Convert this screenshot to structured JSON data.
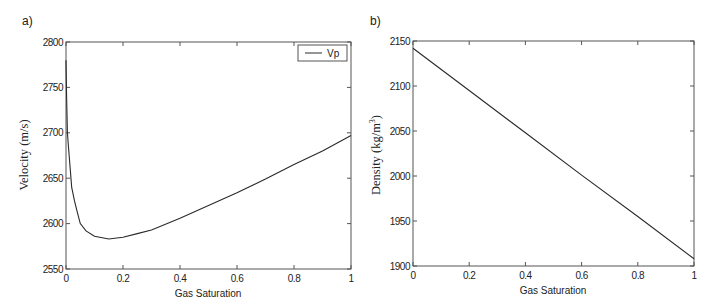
{
  "chart_data": [
    {
      "panel": "a)",
      "type": "line",
      "title": "",
      "xlabel": "Gas Saturation",
      "ylabel": "Velocity (m/s)",
      "xlim": [
        0,
        1
      ],
      "ylim": [
        2550,
        2800
      ],
      "xticks": [
        "0",
        "0.2",
        "0.4",
        "0.6",
        "0.8",
        "1"
      ],
      "yticks": [
        "2550",
        "2600",
        "2650",
        "2700",
        "2750",
        "2800"
      ],
      "grid": false,
      "legend": {
        "position": "upper right",
        "entries": [
          "Vp"
        ]
      },
      "series": [
        {
          "name": "Vp",
          "x": [
            0,
            0.002,
            0.005,
            0.01,
            0.02,
            0.03,
            0.04,
            0.05,
            0.07,
            0.1,
            0.15,
            0.2,
            0.25,
            0.3,
            0.4,
            0.5,
            0.6,
            0.7,
            0.8,
            0.9,
            1.0
          ],
          "y": [
            2780,
            2740,
            2700,
            2680,
            2640,
            2625,
            2612,
            2600,
            2592,
            2586,
            2583,
            2585,
            2589,
            2593,
            2606,
            2620,
            2634,
            2649,
            2665,
            2680,
            2697
          ]
        }
      ]
    },
    {
      "panel": "b)",
      "type": "line",
      "title": "",
      "xlabel": "Gas Saturation",
      "ylabel": "Density (kg/m³)",
      "xlim": [
        0,
        1
      ],
      "ylim": [
        1900,
        2150
      ],
      "xticks": [
        "0",
        "0.2",
        "0.4",
        "0.6",
        "0.8",
        "1"
      ],
      "yticks": [
        "1900",
        "1950",
        "2000",
        "2050",
        "2100",
        "2150"
      ],
      "grid": false,
      "legend": null,
      "series": [
        {
          "name": "Density",
          "x": [
            0,
            0.2,
            0.4,
            0.6,
            0.8,
            1.0
          ],
          "y": [
            2142,
            2095,
            2048,
            2001,
            1955,
            1908
          ]
        }
      ]
    }
  ],
  "panels": {
    "a": {
      "label": "a)",
      "xlabel": "Gas Saturation",
      "ylabel": "Velocity (m/s)",
      "legend_entry": "Vp",
      "xticks": [
        "0",
        "0.2",
        "0.4",
        "0.6",
        "0.8",
        "1"
      ],
      "yticks": [
        "2550",
        "2600",
        "2650",
        "2700",
        "2750",
        "2800"
      ]
    },
    "b": {
      "label": "b)",
      "xlabel": "Gas Saturation",
      "ylabel_main": "Density (kg/m",
      "ylabel_sup": "3",
      "ylabel_close": ")",
      "xticks": [
        "0",
        "0.2",
        "0.4",
        "0.6",
        "0.8",
        "1"
      ],
      "yticks": [
        "1900",
        "1950",
        "2000",
        "2050",
        "2100",
        "2150"
      ]
    }
  },
  "colors": {
    "line": "#2a2a2a",
    "axes": "#555555",
    "background": "#ffffff"
  }
}
